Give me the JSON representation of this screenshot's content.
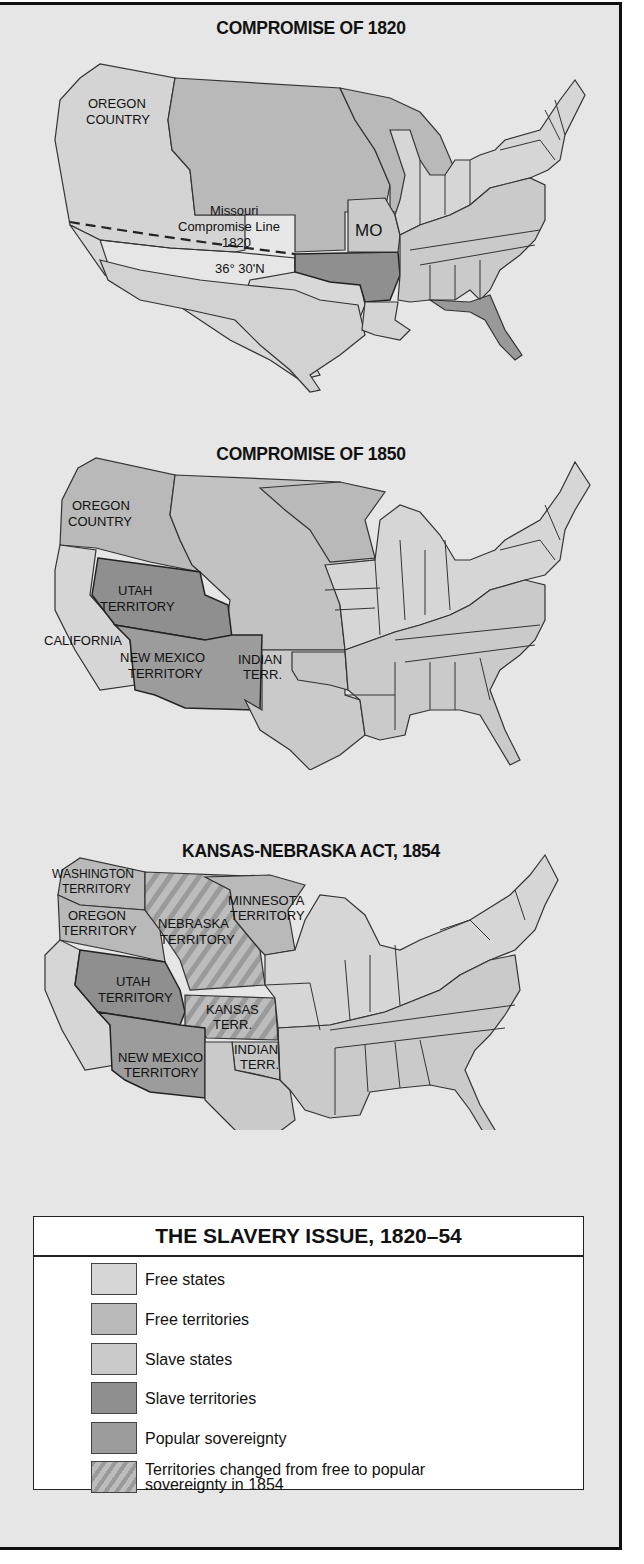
{
  "maps": [
    {
      "title": "COMPROMISE OF 1820",
      "labels": {
        "oregon": [
          "OREGON",
          "COUNTRY"
        ],
        "line": [
          "Missouri",
          "Compromise Line",
          "1820"
        ],
        "latitude": "36° 30'N",
        "mo": "MO"
      }
    },
    {
      "title": "COMPROMISE OF 1850",
      "labels": {
        "oregon": [
          "OREGON",
          "COUNTRY"
        ],
        "utah": [
          "UTAH",
          "TERRITORY"
        ],
        "california": "CALIFORNIA",
        "newmexico": [
          "NEW MEXICO",
          "TERRITORY"
        ],
        "indian": [
          "INDIAN",
          "TERR."
        ]
      }
    },
    {
      "title": "KANSAS-NEBRASKA ACT, 1854",
      "labels": {
        "washington": [
          "WASHINGTON",
          "TERRITORY"
        ],
        "oregon": [
          "OREGON",
          "TERRITORY"
        ],
        "nebraska": [
          "NEBRASKA",
          "TERRITORY"
        ],
        "minnesota": [
          "MINNESOTA",
          "TERRITORY"
        ],
        "utah": [
          "UTAH",
          "TERRITORY"
        ],
        "kansas": [
          "KANSAS",
          "TERR."
        ],
        "newmexico": [
          "NEW MEXICO",
          "TERRITORY"
        ],
        "indian": [
          "INDIAN",
          "TERR."
        ]
      }
    }
  ],
  "legend": {
    "title": "THE SLAVERY ISSUE, 1820–54",
    "items": [
      {
        "label": "Free states",
        "color": "#d6d6d6"
      },
      {
        "label": "Free territories",
        "color": "#b9b9b9"
      },
      {
        "label": "Slave states",
        "color": "#cacaca"
      },
      {
        "label": "Slave territories",
        "color": "#8f8f8f"
      },
      {
        "label": "Popular sovereignty",
        "color": "#9c9c9c"
      },
      {
        "label": "Territories changed from free to popular",
        "label2": "sovereignty in 1854",
        "color": "hatched"
      }
    ]
  },
  "colors": {
    "background": "#e6e6e6",
    "free_states": "#d6d6d6",
    "free_territories": "#b9b9b9",
    "slave_states": "#cacaca",
    "slave_territories": "#8f8f8f",
    "popular_sovereignty": "#9c9c9c",
    "border": "#333333"
  }
}
